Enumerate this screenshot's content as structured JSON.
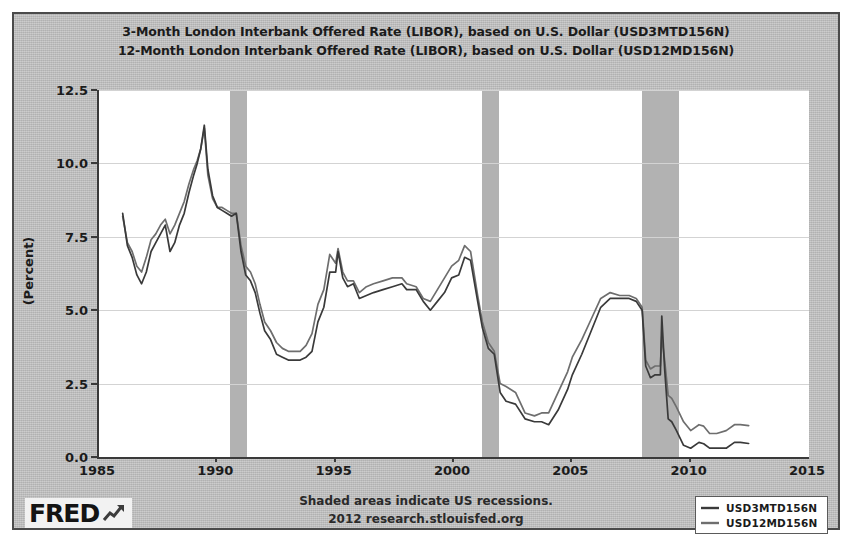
{
  "chart_data": {
    "type": "line",
    "title": "3-Month London Interbank Offered Rate (LIBOR), based on U.S. Dollar (USD3MTD156N)",
    "subtitle": "12-Month London Interbank Offered Rate (LIBOR), based on U.S. Dollar (USD12MD156N)",
    "xlabel": "",
    "ylabel": "(Percent)",
    "xlim": [
      1985,
      2015
    ],
    "ylim": [
      0.0,
      12.5
    ],
    "grid": true,
    "legend_position": "bottom-right",
    "y_ticks": [
      "0.0",
      "2.5",
      "5.0",
      "7.5",
      "10.0",
      "12.5"
    ],
    "y_tick_values": [
      0.0,
      2.5,
      5.0,
      7.5,
      10.0,
      12.5
    ],
    "x_ticks": [
      "1985",
      "1990",
      "1995",
      "2000",
      "2005",
      "2010",
      "2015"
    ],
    "x_tick_values": [
      1985,
      1990,
      1995,
      2000,
      2005,
      2010,
      2015
    ],
    "shaded_regions_note": "Shaded areas indicate US recessions.",
    "shaded_regions": [
      {
        "start": 1990.55,
        "end": 1991.25
      },
      {
        "start": 2001.2,
        "end": 2001.92
      },
      {
        "start": 2007.95,
        "end": 2009.5
      }
    ],
    "series": [
      {
        "name": "USD3MTD156N",
        "label": "3-Month LIBOR, USD",
        "color": "#3a3a3a",
        "x": [
          1986.0,
          1986.2,
          1986.4,
          1986.6,
          1986.8,
          1987.0,
          1987.2,
          1987.4,
          1987.6,
          1987.8,
          1988.0,
          1988.2,
          1988.4,
          1988.6,
          1988.8,
          1989.0,
          1989.15,
          1989.3,
          1989.45,
          1989.6,
          1989.8,
          1990.0,
          1990.2,
          1990.4,
          1990.6,
          1990.8,
          1991.0,
          1991.2,
          1991.4,
          1991.6,
          1991.8,
          1992.0,
          1992.25,
          1992.5,
          1992.75,
          1993.0,
          1993.25,
          1993.5,
          1993.75,
          1994.0,
          1994.25,
          1994.5,
          1994.75,
          1995.0,
          1995.1,
          1995.3,
          1995.5,
          1995.75,
          1996.0,
          1996.3,
          1996.6,
          1997.0,
          1997.4,
          1997.8,
          1998.0,
          1998.4,
          1998.7,
          1999.0,
          1999.3,
          1999.6,
          1999.9,
          2000.2,
          2000.45,
          2000.7,
          2001.0,
          2001.2,
          2001.45,
          2001.7,
          2001.95,
          2002.2,
          2002.6,
          2003.0,
          2003.4,
          2003.7,
          2004.0,
          2004.4,
          2004.8,
          2005.0,
          2005.4,
          2005.8,
          2006.2,
          2006.6,
          2007.0,
          2007.4,
          2007.7,
          2007.95,
          2008.1,
          2008.3,
          2008.5,
          2008.72,
          2008.78,
          2008.9,
          2009.05,
          2009.2,
          2009.4,
          2009.7,
          2010.0,
          2010.35,
          2010.55,
          2010.8,
          2011.1,
          2011.5,
          2011.85,
          2012.1,
          2012.45
        ],
        "y": [
          8.3,
          7.2,
          6.8,
          6.2,
          5.9,
          6.3,
          7.0,
          7.3,
          7.6,
          7.9,
          7.0,
          7.3,
          7.9,
          8.3,
          9.0,
          9.6,
          10.0,
          10.5,
          11.3,
          9.8,
          8.9,
          8.5,
          8.4,
          8.3,
          8.2,
          8.3,
          7.0,
          6.2,
          6.0,
          5.6,
          4.9,
          4.3,
          4.0,
          3.5,
          3.4,
          3.3,
          3.3,
          3.3,
          3.4,
          3.6,
          4.6,
          5.1,
          6.3,
          6.3,
          7.0,
          6.1,
          5.8,
          5.9,
          5.4,
          5.5,
          5.6,
          5.7,
          5.8,
          5.9,
          5.7,
          5.7,
          5.3,
          5.0,
          5.3,
          5.6,
          6.1,
          6.2,
          6.8,
          6.7,
          5.3,
          4.4,
          3.7,
          3.5,
          2.2,
          1.9,
          1.8,
          1.3,
          1.2,
          1.2,
          1.1,
          1.6,
          2.3,
          2.8,
          3.5,
          4.3,
          5.1,
          5.4,
          5.4,
          5.4,
          5.3,
          5.0,
          3.1,
          2.7,
          2.8,
          2.8,
          4.8,
          3.0,
          1.3,
          1.2,
          0.9,
          0.4,
          0.3,
          0.5,
          0.45,
          0.3,
          0.3,
          0.3,
          0.5,
          0.5,
          0.46
        ]
      },
      {
        "name": "USD12MD156N",
        "label": "12-Month LIBOR, USD",
        "color": "#6e6e6e",
        "x": [
          1986.0,
          1986.2,
          1986.4,
          1986.6,
          1986.8,
          1987.0,
          1987.2,
          1987.4,
          1987.6,
          1987.8,
          1988.0,
          1988.2,
          1988.4,
          1988.6,
          1988.8,
          1989.0,
          1989.15,
          1989.3,
          1989.45,
          1989.6,
          1989.8,
          1990.0,
          1990.2,
          1990.4,
          1990.6,
          1990.8,
          1991.0,
          1991.2,
          1991.4,
          1991.6,
          1991.8,
          1992.0,
          1992.25,
          1992.5,
          1992.75,
          1993.0,
          1993.25,
          1993.5,
          1993.75,
          1994.0,
          1994.25,
          1994.5,
          1994.75,
          1995.0,
          1995.1,
          1995.3,
          1995.5,
          1995.75,
          1996.0,
          1996.3,
          1996.6,
          1997.0,
          1997.4,
          1997.8,
          1998.0,
          1998.4,
          1998.7,
          1999.0,
          1999.3,
          1999.6,
          1999.9,
          2000.2,
          2000.45,
          2000.7,
          2001.0,
          2001.2,
          2001.45,
          2001.7,
          2001.95,
          2002.2,
          2002.6,
          2003.0,
          2003.4,
          2003.7,
          2004.0,
          2004.4,
          2004.8,
          2005.0,
          2005.4,
          2005.8,
          2006.2,
          2006.6,
          2007.0,
          2007.4,
          2007.7,
          2007.95,
          2008.1,
          2008.3,
          2008.5,
          2008.72,
          2008.78,
          2008.9,
          2009.05,
          2009.2,
          2009.4,
          2009.7,
          2010.0,
          2010.35,
          2010.55,
          2010.8,
          2011.1,
          2011.5,
          2011.85,
          2012.1,
          2012.45
        ],
        "y": [
          8.2,
          7.3,
          7.0,
          6.5,
          6.3,
          6.8,
          7.4,
          7.6,
          7.9,
          8.1,
          7.6,
          7.9,
          8.3,
          8.7,
          9.3,
          9.8,
          10.1,
          10.5,
          11.2,
          9.6,
          8.8,
          8.5,
          8.5,
          8.4,
          8.3,
          8.3,
          7.2,
          6.5,
          6.3,
          5.9,
          5.2,
          4.6,
          4.3,
          3.9,
          3.7,
          3.6,
          3.6,
          3.6,
          3.8,
          4.2,
          5.2,
          5.7,
          6.9,
          6.6,
          7.1,
          6.3,
          6.0,
          6.0,
          5.6,
          5.8,
          5.9,
          6.0,
          6.1,
          6.1,
          5.9,
          5.8,
          5.4,
          5.3,
          5.7,
          6.1,
          6.5,
          6.7,
          7.2,
          7.0,
          5.5,
          4.6,
          3.9,
          3.6,
          2.5,
          2.4,
          2.2,
          1.5,
          1.4,
          1.5,
          1.5,
          2.2,
          2.9,
          3.4,
          4.0,
          4.7,
          5.4,
          5.6,
          5.5,
          5.5,
          5.4,
          5.1,
          3.3,
          3.0,
          3.1,
          3.1,
          4.1,
          3.3,
          2.1,
          2.0,
          1.7,
          1.2,
          0.9,
          1.1,
          1.05,
          0.8,
          0.8,
          0.9,
          1.1,
          1.1,
          1.07
        ]
      }
    ]
  },
  "title": {
    "line1": "3-Month London Interbank Offered Rate (LIBOR), based on U.S. Dollar (USD3MTD156N)",
    "line2": "12-Month London Interbank Offered Rate (LIBOR), based on U.S. Dollar (USD12MD156N)"
  },
  "axes": {
    "y_label": "(Percent)",
    "y_ticks": [
      "12.5",
      "10.0",
      "7.5",
      "5.0",
      "2.5",
      "0.0"
    ],
    "x_ticks": [
      "1985",
      "1990",
      "1995",
      "2000",
      "2005",
      "2010",
      "2015"
    ]
  },
  "footer": {
    "line1": "Shaded areas indicate US recessions.",
    "line2": "2012 research.stlouisfed.org"
  },
  "logo": {
    "word": "FRED",
    "mark": "chart-arrow-icon"
  },
  "legend": {
    "items": [
      {
        "label": "USD3MTD156N",
        "color": "#3a3a3a"
      },
      {
        "label": "USD12MD156N",
        "color": "#6e6e6e"
      }
    ]
  },
  "colors": {
    "panel_background": "#bfbfbf",
    "plot_background": "#ffffff",
    "recession_shade": "#b2b2b2",
    "gridline": "#d3d3d3",
    "axis": "#3a3a3a",
    "series_3m": "#3a3a3a",
    "series_12m": "#6e6e6e"
  }
}
